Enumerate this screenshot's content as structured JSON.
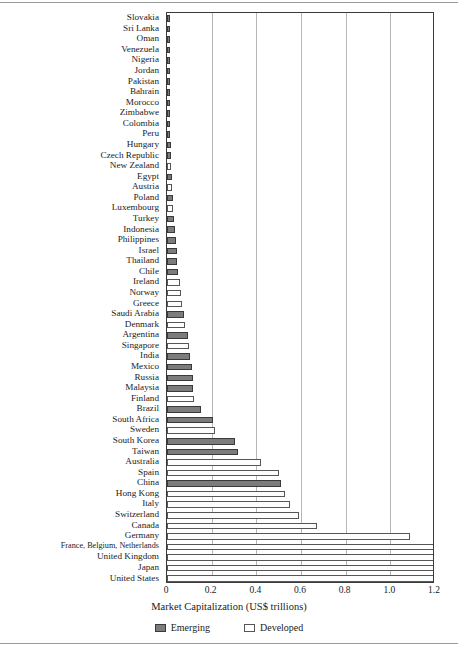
{
  "chart_data": {
    "type": "bar",
    "orientation": "horizontal",
    "title": "",
    "xlabel": "Market Capitalization (US$ trillions)",
    "ylabel": "",
    "xlim": [
      0,
      1.2
    ],
    "xticks": [
      0,
      0.2,
      0.4,
      0.6,
      0.8,
      1.0,
      1.2
    ],
    "xtick_labels": [
      "0",
      "0.2",
      "0.4",
      "0.6",
      "0.8",
      "1.0",
      "1.2"
    ],
    "grid": "vertical",
    "legend_position": "bottom-center",
    "legend": [
      {
        "label": "Emerging",
        "color": "#7c7c7c"
      },
      {
        "label": "Developed",
        "color": "#ffffff"
      }
    ],
    "categories": [
      "Slovakia",
      "Sri Lanka",
      "Oman",
      "Venezuela",
      "Nigeria",
      "Jordan",
      "Pakistan",
      "Bahrain",
      "Morocco",
      "Zimbabwe",
      "Colombia",
      "Peru",
      "Hungary",
      "Czech Republic",
      "New Zealand",
      "Egypt",
      "Austria",
      "Poland",
      "Luxembourg",
      "Turkey",
      "Indonesia",
      "Philippines",
      "Israel",
      "Thailand",
      "Chile",
      "Ireland",
      "Norway",
      "Greece",
      "Saudi Arabia",
      "Denmark",
      "Argentina",
      "Singapore",
      "India",
      "Mexico",
      "Russia",
      "Malaysia",
      "Finland",
      "Brazil",
      "South Africa",
      "Sweden",
      "South Korea",
      "Taiwan",
      "Australia",
      "Spain",
      "China",
      "Hong Kong",
      "Italy",
      "Switzerland",
      "Canada",
      "Germany",
      "France, Belgium, Netherlands",
      "United Kingdom",
      "Japan",
      "United States"
    ],
    "groups": [
      "Emerging",
      "Emerging",
      "Emerging",
      "Emerging",
      "Emerging",
      "Emerging",
      "Emerging",
      "Emerging",
      "Emerging",
      "Emerging",
      "Emerging",
      "Emerging",
      "Emerging",
      "Emerging",
      "Developed",
      "Emerging",
      "Developed",
      "Emerging",
      "Developed",
      "Emerging",
      "Emerging",
      "Emerging",
      "Emerging",
      "Emerging",
      "Emerging",
      "Developed",
      "Developed",
      "Developed",
      "Emerging",
      "Developed",
      "Emerging",
      "Developed",
      "Emerging",
      "Emerging",
      "Emerging",
      "Emerging",
      "Developed",
      "Emerging",
      "Emerging",
      "Developed",
      "Emerging",
      "Emerging",
      "Developed",
      "Developed",
      "Emerging",
      "Developed",
      "Developed",
      "Developed",
      "Developed",
      "Developed",
      "Developed",
      "Developed",
      "Developed",
      "Developed"
    ],
    "values": [
      0.002,
      0.003,
      0.004,
      0.005,
      0.006,
      0.007,
      0.008,
      0.009,
      0.011,
      0.012,
      0.013,
      0.014,
      0.016,
      0.017,
      0.019,
      0.021,
      0.023,
      0.026,
      0.028,
      0.031,
      0.034,
      0.039,
      0.043,
      0.046,
      0.05,
      0.057,
      0.063,
      0.068,
      0.075,
      0.08,
      0.095,
      0.1,
      0.105,
      0.11,
      0.115,
      0.118,
      0.122,
      0.15,
      0.205,
      0.215,
      0.305,
      0.32,
      0.42,
      0.5,
      0.51,
      0.53,
      0.55,
      0.59,
      0.67,
      1.09,
      1.21,
      1.21,
      1.21,
      1.21
    ],
    "value_unit": "US$ trillions",
    "note_clipped": "The four longest bars (France/Belgium/Netherlands, United Kingdom, Japan, United States) extend beyond the 1.2 axis limit and are clipped at the plot edge."
  }
}
